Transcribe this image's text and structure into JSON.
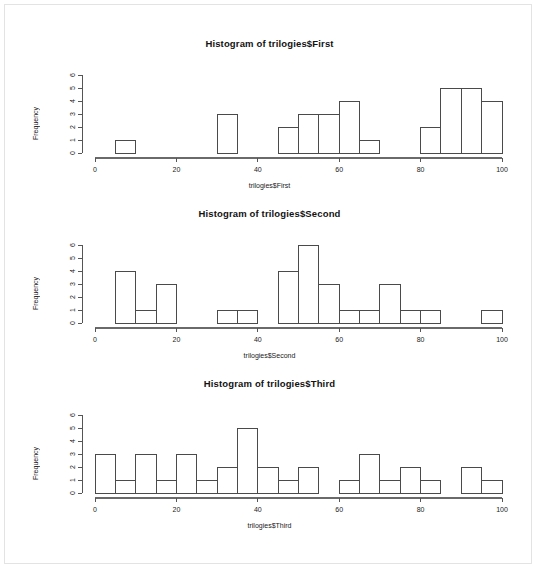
{
  "page": {
    "background_color": "#ffffff",
    "frame_color": "#e3e3e3",
    "axis_color": "#555555",
    "bar_stroke_color": "#4a4a4a"
  },
  "chart_data": [
    {
      "type": "bar",
      "subtype": "histogram",
      "title": "Histogram of trilogies$First",
      "xlabel": "trilogies$First",
      "ylabel": "Frequency",
      "xlim": [
        0,
        100
      ],
      "ylim": [
        0,
        6
      ],
      "bin_width": 5,
      "grid": false,
      "legend": "none",
      "xticks": [
        0,
        20,
        40,
        60,
        80,
        100
      ],
      "xtick_labels": [
        "0",
        "20",
        "40",
        "60",
        "80",
        "100"
      ],
      "yticks": [
        0,
        1,
        2,
        3,
        4,
        5,
        6
      ],
      "ytick_labels": [
        "0",
        "1",
        "2",
        "3",
        "4",
        "5",
        "6"
      ],
      "bin_edges": [
        0,
        5,
        10,
        15,
        20,
        25,
        30,
        35,
        40,
        45,
        50,
        55,
        60,
        65,
        70,
        75,
        80,
        85,
        90,
        95,
        100
      ],
      "values": [
        0,
        1,
        0,
        0,
        0,
        0,
        3,
        0,
        0,
        2,
        3,
        3,
        4,
        1,
        0,
        0,
        2,
        5,
        5,
        4,
        2
      ]
    },
    {
      "type": "bar",
      "subtype": "histogram",
      "title": "Histogram of trilogies$Second",
      "xlabel": "trilogies$Second",
      "ylabel": "Frequency",
      "xlim": [
        0,
        100
      ],
      "ylim": [
        0,
        6
      ],
      "bin_width": 5,
      "grid": false,
      "legend": "none",
      "xticks": [
        0,
        20,
        40,
        60,
        80,
        100
      ],
      "xtick_labels": [
        "0",
        "20",
        "40",
        "60",
        "80",
        "100"
      ],
      "yticks": [
        0,
        1,
        2,
        3,
        4,
        5,
        6
      ],
      "ytick_labels": [
        "0",
        "1",
        "2",
        "3",
        "4",
        "5",
        "6"
      ],
      "bin_edges": [
        0,
        5,
        10,
        15,
        20,
        25,
        30,
        35,
        40,
        45,
        50,
        55,
        60,
        65,
        70,
        75,
        80,
        85,
        90,
        95,
        100
      ],
      "values": [
        0,
        4,
        1,
        3,
        0,
        0,
        1,
        1,
        0,
        4,
        6,
        3,
        1,
        1,
        3,
        1,
        1,
        0,
        0,
        1,
        4
      ]
    },
    {
      "type": "bar",
      "subtype": "histogram",
      "title": "Histogram of trilogies$Third",
      "xlabel": "trilogies$Third",
      "ylabel": "Frequency",
      "xlim": [
        0,
        100
      ],
      "ylim": [
        0,
        6
      ],
      "bin_width": 5,
      "grid": false,
      "legend": "none",
      "xticks": [
        0,
        20,
        40,
        60,
        80,
        100
      ],
      "xtick_labels": [
        "0",
        "20",
        "40",
        "60",
        "80",
        "100"
      ],
      "yticks": [
        0,
        1,
        2,
        3,
        4,
        5,
        6
      ],
      "ytick_labels": [
        "0",
        "1",
        "2",
        "3",
        "4",
        "5",
        "6"
      ],
      "bin_edges": [
        0,
        5,
        10,
        15,
        20,
        25,
        30,
        35,
        40,
        45,
        50,
        55,
        60,
        65,
        70,
        75,
        80,
        85,
        90,
        95,
        100
      ],
      "values": [
        3,
        1,
        3,
        1,
        3,
        1,
        2,
        5,
        2,
        1,
        2,
        0,
        1,
        3,
        1,
        2,
        1,
        0,
        2,
        1
      ]
    }
  ]
}
